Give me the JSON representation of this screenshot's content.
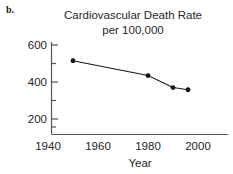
{
  "panel": {
    "label": "b."
  },
  "chart_data": {
    "type": "line",
    "title": "Cardiovascular Death Rate per 100,000",
    "title_lines": [
      "Cardiovascular Death Rate",
      "per 100,000"
    ],
    "xlabel": "Year",
    "ylabel": "",
    "x": [
      1950,
      1980,
      1990,
      1996
    ],
    "values": [
      515,
      435,
      370,
      358
    ],
    "series": [
      {
        "name": "Cardiovascular Death Rate per 100,000",
        "x": [
          1950,
          1980,
          1990,
          1996
        ],
        "values": [
          515,
          435,
          370,
          358
        ]
      }
    ],
    "xlim": [
      1935,
      2005
    ],
    "ylim": [
      0,
      650
    ],
    "xticks": [
      1940,
      1960,
      1980,
      2000
    ],
    "xtick_labels": [
      "1940",
      "1960",
      "1980",
      "2000"
    ],
    "yticks": [
      200,
      400,
      600
    ],
    "ytick_labels": [
      "200",
      "400",
      "600"
    ],
    "yticks_minor": [
      100,
      300,
      500
    ],
    "grid": false,
    "legend": false,
    "marker": "filled-circle",
    "line_color": "#1a1a1a",
    "marker_color": "#111111"
  }
}
